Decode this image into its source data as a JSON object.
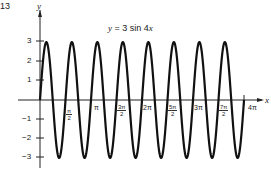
{
  "figure_number": "13",
  "chart_data": {
    "type": "line",
    "title": "y = 3 sin 4x",
    "xlabel": "x",
    "ylabel": "y",
    "function": "y = 3*sin(4*x)",
    "amplitude": 3,
    "period": "π/2",
    "xlim": [
      0,
      "4π"
    ],
    "ylim": [
      -3,
      3
    ],
    "x_ticks": [
      "π/2",
      "π",
      "3π/2",
      "2π",
      "5π/2",
      "3π",
      "7π/2",
      "4π"
    ],
    "y_ticks": [
      3,
      2,
      1,
      -1,
      -2,
      -3
    ],
    "grid": false,
    "legend": null,
    "series": [
      {
        "name": "y = 3 sin 4x",
        "x": [
          "0",
          "π/8",
          "π/4",
          "3π/8",
          "π/2",
          "π",
          "3π/2",
          "2π",
          "5π/2",
          "3π",
          "7π/2",
          "4π"
        ],
        "values": [
          0,
          3,
          0,
          -3,
          0,
          0,
          0,
          0,
          0,
          0,
          0,
          0
        ]
      }
    ]
  },
  "labels": {
    "title_y": "y",
    "title_eq": "= 3 sin 4",
    "title_x": "x",
    "axis_y": "y",
    "axis_x": "x",
    "y3": "3",
    "y2": "2",
    "y1": "1",
    "ym1": "−1",
    "ym2": "−2",
    "ym3": "−3",
    "t_pi": "π",
    "t_2pi": "2π",
    "t_3pi": "3π",
    "t_4pi": "4π",
    "f1_num": "π",
    "f1_den": "2",
    "f3_num": "3π",
    "f3_den": "2",
    "f5_num": "5π",
    "f5_den": "2",
    "f7_num": "7π",
    "f7_den": "2"
  }
}
